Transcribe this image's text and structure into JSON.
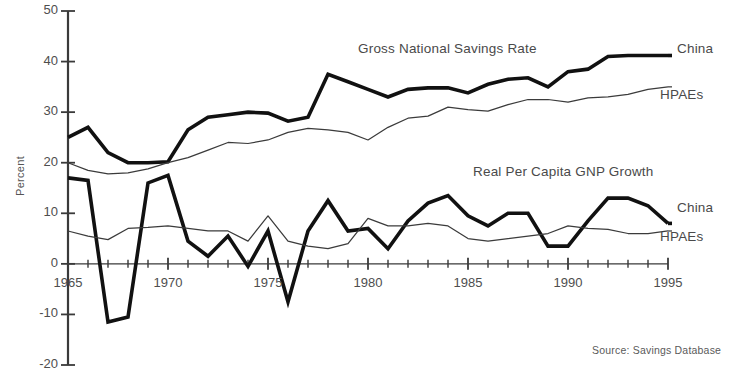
{
  "figure": {
    "source_note": "Source:  Savings Database",
    "y_axis_title": "Percent",
    "annotations": [
      {
        "text": "Gross National Savings Rate",
        "x": 358,
        "y": 41
      },
      {
        "text": "Real Per Capita GNP Growth",
        "x": 473,
        "y": 164
      }
    ],
    "series_labels": [
      {
        "text": "China",
        "x": 677,
        "y": 41
      },
      {
        "text": "HPAEs",
        "x": 660,
        "y": 87
      },
      {
        "text": "China",
        "x": 677,
        "y": 200
      },
      {
        "text": "HPAEs",
        "x": 660,
        "y": 229
      }
    ],
    "colors": {
      "china": "#111111",
      "hpae": "#3b3b3b",
      "axis": "#3a3a3a",
      "text": "#4a4a4a",
      "background": "#ffffff"
    }
  },
  "chart_data": {
    "type": "line",
    "title": "",
    "xlabel": "",
    "ylabel": "Percent",
    "xlim": [
      1965,
      1995
    ],
    "ylim": [
      -20,
      50
    ],
    "ytick_labels": [
      "50",
      "40",
      "30",
      "20",
      "10",
      "0",
      "-10",
      "-20"
    ],
    "ytick_values": [
      50,
      40,
      30,
      20,
      10,
      0,
      -10,
      -20
    ],
    "xtick_labels": [
      "1965",
      "1970",
      "1975",
      "1980",
      "1985",
      "1990",
      "1995"
    ],
    "xtick_values": [
      1965,
      1970,
      1975,
      1980,
      1985,
      1990,
      1995
    ],
    "xtick_minor_step": 1,
    "grid": false,
    "legend_position": "right-inline",
    "x": [
      1965,
      1966,
      1967,
      1968,
      1969,
      1970,
      1971,
      1972,
      1973,
      1974,
      1975,
      1976,
      1977,
      1978,
      1979,
      1980,
      1981,
      1982,
      1983,
      1984,
      1985,
      1986,
      1987,
      1988,
      1989,
      1990,
      1991,
      1992,
      1993,
      1994,
      1995
    ],
    "series": [
      {
        "name": "China",
        "group": "Gross National Savings Rate",
        "style": "thick",
        "values": [
          25.0,
          27.0,
          22.0,
          20.0,
          20.0,
          20.2,
          26.5,
          29.0,
          29.5,
          30.0,
          29.8,
          28.2,
          29.0,
          37.5,
          36.0,
          34.5,
          33.0,
          34.5,
          34.8,
          34.8,
          33.8,
          35.5,
          36.5,
          36.8,
          35.0,
          38.0,
          38.5,
          41.0,
          41.2,
          41.2,
          41.2
        ]
      },
      {
        "name": "HPAEs",
        "group": "Gross National Savings Rate",
        "style": "thin",
        "values": [
          20.0,
          18.5,
          17.8,
          18.0,
          18.8,
          20.0,
          21.0,
          22.5,
          24.0,
          23.8,
          24.5,
          26.0,
          26.8,
          26.5,
          26.0,
          24.5,
          27.0,
          28.8,
          29.2,
          31.0,
          30.5,
          30.2,
          31.5,
          32.5,
          32.5,
          32.0,
          32.8,
          33.0,
          33.5,
          34.5,
          35.0
        ]
      },
      {
        "name": "China",
        "group": "Real Per Capita GNP Growth",
        "style": "thick",
        "values": [
          17.0,
          16.5,
          -11.5,
          -10.5,
          16.0,
          17.5,
          4.5,
          1.5,
          5.5,
          -0.5,
          6.5,
          -7.5,
          6.5,
          12.5,
          6.5,
          7.0,
          3.0,
          8.5,
          12.0,
          13.5,
          9.5,
          7.5,
          10.0,
          10.0,
          3.5,
          3.5,
          8.5,
          13.0,
          13.0,
          11.5,
          8.0
        ]
      },
      {
        "name": "HPAEs",
        "group": "Real Per Capita GNP Growth",
        "style": "thin",
        "values": [
          6.5,
          5.5,
          4.8,
          7.0,
          7.2,
          7.5,
          7.0,
          6.5,
          6.5,
          4.5,
          9.5,
          4.5,
          3.5,
          3.0,
          4.0,
          9.0,
          7.5,
          7.5,
          8.0,
          7.5,
          5.0,
          4.5,
          5.0,
          5.5,
          6.0,
          7.5,
          7.0,
          6.8,
          6.0,
          6.0,
          6.5
        ]
      }
    ]
  }
}
